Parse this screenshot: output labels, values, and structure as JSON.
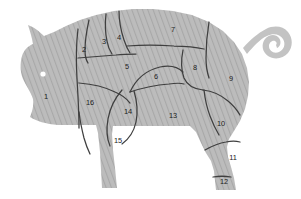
{
  "diagram": {
    "body_fill": "#b5b5b5",
    "hatch_color": "#a5a5a5",
    "outline_color": "#3a3a3a",
    "label_color": "#1c1c1c",
    "background": "#ffffff",
    "eye_color": "#ffffff",
    "cuts": [
      {
        "id": "1",
        "label": "1",
        "x": 46,
        "y": 97
      },
      {
        "id": "2",
        "label": "2",
        "x": 84,
        "y": 50
      },
      {
        "id": "3",
        "label": "3",
        "x": 104,
        "y": 42
      },
      {
        "id": "4",
        "label": "4",
        "x": 119,
        "y": 38
      },
      {
        "id": "5",
        "label": "5",
        "x": 127,
        "y": 67
      },
      {
        "id": "6",
        "label": "6",
        "x": 156,
        "y": 77
      },
      {
        "id": "7",
        "label": "7",
        "x": 173,
        "y": 30
      },
      {
        "id": "8",
        "label": "8",
        "x": 195,
        "y": 68
      },
      {
        "id": "9",
        "label": "9",
        "x": 231,
        "y": 79
      },
      {
        "id": "10",
        "label": "10",
        "x": 221,
        "y": 124
      },
      {
        "id": "11",
        "label": "11",
        "x": 233,
        "y": 158
      },
      {
        "id": "12",
        "label": "12",
        "x": 224,
        "y": 182
      },
      {
        "id": "13",
        "label": "13",
        "x": 173,
        "y": 116
      },
      {
        "id": "14",
        "label": "14",
        "x": 128,
        "y": 112
      },
      {
        "id": "15",
        "label": "15",
        "x": 118,
        "y": 141
      },
      {
        "id": "16",
        "label": "16",
        "x": 90,
        "y": 103
      }
    ]
  }
}
